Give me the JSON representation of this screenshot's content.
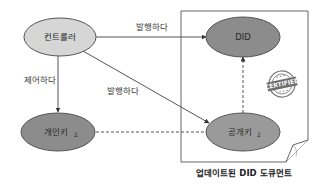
{
  "nodes": {
    "controller": {
      "label": "컨트롤러",
      "fill": "#d6d6d6"
    },
    "did": {
      "label": "DID",
      "fill": "#8c8c8c"
    },
    "private_key": {
      "label": "개인키",
      "subscript": "2",
      "fill": "#8c8c8c"
    },
    "public_key": {
      "label": "공개키",
      "subscript": "2",
      "fill": "#9a9a9a"
    }
  },
  "edges": {
    "controller_to_did": {
      "label": "발행하다",
      "style": "solid"
    },
    "controller_to_private_key": {
      "label": "제어하다",
      "style": "solid"
    },
    "controller_to_public_key": {
      "label": "발행하다",
      "style": "solid"
    },
    "private_key_to_public_key": {
      "label": "",
      "style": "dashed"
    },
    "public_key_to_did": {
      "label": "",
      "style": "dashed"
    }
  },
  "document": {
    "caption": "업데이트된 DID 도큐먼트"
  },
  "stamp": {
    "text": "CERTIFIED"
  },
  "colors": {
    "stroke": "#555555",
    "frame": "#666666"
  }
}
